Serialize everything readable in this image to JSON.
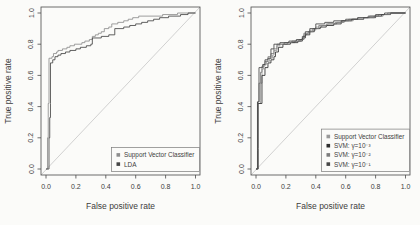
{
  "figure": {
    "background_color": "#fbfbf9",
    "axis_color": "#4a4a4a",
    "text_color": "#3d3d3d",
    "diagonal_color": "#cccccc"
  },
  "chart_data": [
    {
      "type": "line",
      "subtype": "roc-step",
      "title": "",
      "xlabel": "False positive rate",
      "ylabel": "True positive rate",
      "xlim": [
        0,
        1
      ],
      "ylim": [
        0,
        1
      ],
      "grid": false,
      "diagonal_reference": true,
      "xticks": [
        0.0,
        0.2,
        0.4,
        0.6,
        0.8,
        1.0
      ],
      "yticks": [
        0.0,
        0.2,
        0.4,
        0.6,
        0.8,
        1.0
      ],
      "xtick_labels": [
        "0.0",
        "0.2",
        "0.4",
        "0.6",
        "0.8",
        "1.0"
      ],
      "ytick_labels": [
        "0.0",
        "0.2",
        "0.4",
        "0.6",
        "0.8",
        "1.0"
      ],
      "legend_position": "bottomright",
      "series": [
        {
          "name": "Support Vector Classifier",
          "color": "#8e8e8e",
          "points": [
            [
              0,
              0
            ],
            [
              0.01,
              0.2
            ],
            [
              0.015,
              0.33
            ],
            [
              0.015,
              0.42
            ],
            [
              0.02,
              0.71
            ],
            [
              0.04,
              0.72
            ],
            [
              0.05,
              0.74
            ],
            [
              0.07,
              0.75
            ],
            [
              0.08,
              0.76
            ],
            [
              0.11,
              0.77
            ],
            [
              0.14,
              0.78
            ],
            [
              0.16,
              0.79
            ],
            [
              0.19,
              0.8
            ],
            [
              0.24,
              0.81
            ],
            [
              0.26,
              0.82
            ],
            [
              0.29,
              0.83
            ],
            [
              0.31,
              0.85
            ],
            [
              0.33,
              0.86
            ],
            [
              0.35,
              0.87
            ],
            [
              0.37,
              0.88
            ],
            [
              0.39,
              0.9
            ],
            [
              0.42,
              0.91
            ],
            [
              0.44,
              0.93
            ],
            [
              0.48,
              0.94
            ],
            [
              0.52,
              0.95
            ],
            [
              0.55,
              0.96
            ],
            [
              0.58,
              0.97
            ],
            [
              0.62,
              0.98
            ],
            [
              0.78,
              0.99
            ],
            [
              0.88,
              1
            ],
            [
              1,
              1
            ]
          ]
        },
        {
          "name": "LDA",
          "color": "#464646",
          "points": [
            [
              0,
              0
            ],
            [
              0.02,
              0.2
            ],
            [
              0.025,
              0.33
            ],
            [
              0.03,
              0.42
            ],
            [
              0.03,
              0.68
            ],
            [
              0.045,
              0.7
            ],
            [
              0.06,
              0.72
            ],
            [
              0.08,
              0.73
            ],
            [
              0.1,
              0.74
            ],
            [
              0.13,
              0.75
            ],
            [
              0.16,
              0.76
            ],
            [
              0.2,
              0.77
            ],
            [
              0.23,
              0.78
            ],
            [
              0.27,
              0.79
            ],
            [
              0.3,
              0.8
            ],
            [
              0.31,
              0.84
            ],
            [
              0.37,
              0.85
            ],
            [
              0.42,
              0.86
            ],
            [
              0.46,
              0.9
            ],
            [
              0.52,
              0.91
            ],
            [
              0.56,
              0.92
            ],
            [
              0.6,
              0.93
            ],
            [
              0.64,
              0.94
            ],
            [
              0.68,
              0.95
            ],
            [
              0.72,
              0.96
            ],
            [
              0.76,
              0.97
            ],
            [
              0.82,
              0.98
            ],
            [
              0.9,
              0.99
            ],
            [
              0.95,
              1
            ],
            [
              1,
              1
            ]
          ]
        }
      ]
    },
    {
      "type": "line",
      "subtype": "roc-step",
      "title": "",
      "xlabel": "False positive rate",
      "ylabel": "True positive rate",
      "xlim": [
        0,
        1
      ],
      "ylim": [
        0,
        1
      ],
      "grid": false,
      "diagonal_reference": true,
      "xticks": [
        0.0,
        0.2,
        0.4,
        0.6,
        0.8,
        1.0
      ],
      "yticks": [
        0.0,
        0.2,
        0.4,
        0.6,
        0.8,
        1.0
      ],
      "xtick_labels": [
        "0.0",
        "0.2",
        "0.4",
        "0.6",
        "0.8",
        "1.0"
      ],
      "ytick_labels": [
        "0.0",
        "0.2",
        "0.4",
        "0.6",
        "0.8",
        "1.0"
      ],
      "legend_position": "bottomright",
      "series": [
        {
          "name": "Support Vector Classifier",
          "color": "#9a9a9a",
          "points": [
            [
              0,
              0
            ],
            [
              0.01,
              0.21
            ],
            [
              0.01,
              0.42
            ],
            [
              0.03,
              0.44
            ],
            [
              0.03,
              0.55
            ],
            [
              0.04,
              0.64
            ],
            [
              0.05,
              0.67
            ],
            [
              0.07,
              0.69
            ],
            [
              0.09,
              0.71
            ],
            [
              0.11,
              0.73
            ],
            [
              0.12,
              0.76
            ],
            [
              0.14,
              0.79
            ],
            [
              0.16,
              0.8
            ],
            [
              0.21,
              0.81
            ],
            [
              0.26,
              0.82
            ],
            [
              0.3,
              0.83
            ],
            [
              0.32,
              0.86
            ],
            [
              0.34,
              0.87
            ],
            [
              0.36,
              0.89
            ],
            [
              0.4,
              0.91
            ],
            [
              0.44,
              0.92
            ],
            [
              0.48,
              0.93
            ],
            [
              0.54,
              0.94
            ],
            [
              0.58,
              0.95
            ],
            [
              0.62,
              0.96
            ],
            [
              0.68,
              0.97
            ],
            [
              0.76,
              0.98
            ],
            [
              0.82,
              0.99
            ],
            [
              0.88,
              1
            ],
            [
              1,
              1
            ]
          ]
        },
        {
          "name": "SVM: γ=10⁻³",
          "color": "#2e2e2e",
          "points": [
            [
              0,
              0
            ],
            [
              0.015,
              0.13
            ],
            [
              0.015,
              0.42
            ],
            [
              0.04,
              0.43
            ],
            [
              0.04,
              0.6
            ],
            [
              0.06,
              0.65
            ],
            [
              0.08,
              0.68
            ],
            [
              0.1,
              0.7
            ],
            [
              0.12,
              0.72
            ],
            [
              0.13,
              0.75
            ],
            [
              0.15,
              0.78
            ],
            [
              0.18,
              0.8
            ],
            [
              0.23,
              0.81
            ],
            [
              0.28,
              0.82
            ],
            [
              0.31,
              0.84
            ],
            [
              0.33,
              0.86
            ],
            [
              0.36,
              0.88
            ],
            [
              0.39,
              0.9
            ],
            [
              0.43,
              0.91
            ],
            [
              0.47,
              0.92
            ],
            [
              0.52,
              0.93
            ],
            [
              0.57,
              0.95
            ],
            [
              0.64,
              0.96
            ],
            [
              0.72,
              0.97
            ],
            [
              0.8,
              0.98
            ],
            [
              0.84,
              0.99
            ],
            [
              0.9,
              1
            ],
            [
              1,
              1
            ]
          ]
        },
        {
          "name": "SVM: γ=10⁻²",
          "color": "#7d7d7d",
          "points": [
            [
              0,
              0
            ],
            [
              0.01,
              0.25
            ],
            [
              0.01,
              0.43
            ],
            [
              0.02,
              0.55
            ],
            [
              0.03,
              0.62
            ],
            [
              0.04,
              0.66
            ],
            [
              0.06,
              0.69
            ],
            [
              0.08,
              0.72
            ],
            [
              0.1,
              0.74
            ],
            [
              0.12,
              0.77
            ],
            [
              0.14,
              0.8
            ],
            [
              0.19,
              0.81
            ],
            [
              0.24,
              0.82
            ],
            [
              0.29,
              0.83
            ],
            [
              0.32,
              0.87
            ],
            [
              0.35,
              0.88
            ],
            [
              0.38,
              0.9
            ],
            [
              0.42,
              0.92
            ],
            [
              0.47,
              0.93
            ],
            [
              0.53,
              0.94
            ],
            [
              0.59,
              0.95
            ],
            [
              0.65,
              0.96
            ],
            [
              0.72,
              0.97
            ],
            [
              0.79,
              0.98
            ],
            [
              0.85,
              0.99
            ],
            [
              0.9,
              1
            ],
            [
              1,
              1
            ]
          ]
        },
        {
          "name": "SVM: γ=10⁻¹",
          "color": "#474747",
          "points": [
            [
              0,
              0
            ],
            [
              0.01,
              0.12
            ],
            [
              0.01,
              0.43
            ],
            [
              0.02,
              0.43
            ],
            [
              0.02,
              0.65
            ],
            [
              0.045,
              0.67
            ],
            [
              0.06,
              0.7
            ],
            [
              0.08,
              0.71
            ],
            [
              0.1,
              0.77
            ],
            [
              0.12,
              0.8
            ],
            [
              0.16,
              0.81
            ],
            [
              0.22,
              0.82
            ],
            [
              0.27,
              0.83
            ],
            [
              0.31,
              0.85
            ],
            [
              0.33,
              0.88
            ],
            [
              0.36,
              0.9
            ],
            [
              0.4,
              0.93
            ],
            [
              0.46,
              0.94
            ],
            [
              0.52,
              0.95
            ],
            [
              0.6,
              0.96
            ],
            [
              0.68,
              0.97
            ],
            [
              0.75,
              0.98
            ],
            [
              0.8,
              0.99
            ],
            [
              0.86,
              1
            ],
            [
              1,
              1
            ]
          ]
        }
      ]
    }
  ]
}
